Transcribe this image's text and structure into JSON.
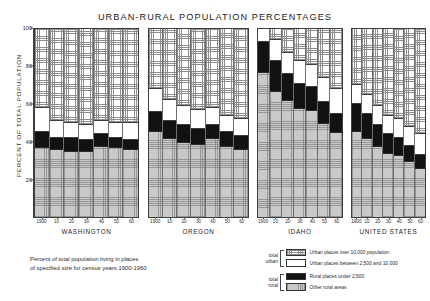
{
  "page_mark": "··",
  "chart_title": "URBAN-RURAL POPULATION PERCENTAGES",
  "y_axis_label": "PERCENT OF TOTAL POPULATION",
  "caption_line1": "Percent of total population living in places",
  "caption_line2": "of specified size for census years 1900-1960",
  "legend": {
    "group_urban_line1": "total",
    "group_urban_line2": "urban",
    "group_rural_line1": "total",
    "group_rural_line2": "rural",
    "items": [
      {
        "key": "urban-large",
        "label": "Urban places over 10,000 population"
      },
      {
        "key": "urban-small",
        "label": "Urban places between 2,500 and 10,000"
      },
      {
        "key": "rural-place",
        "label": "Rural places under 2,500"
      },
      {
        "key": "rural-other",
        "label": "Other rural areas"
      }
    ]
  },
  "chart_data": {
    "type": "bar",
    "subtype": "stacked-100-percent",
    "title": "URBAN-RURAL POPULATION PERCENTAGES",
    "xlabel": "",
    "ylabel": "PERCENT OF TOTAL POPULATION",
    "ylim": [
      0,
      100
    ],
    "yticks": [
      20,
      40,
      60,
      80,
      100
    ],
    "grid": false,
    "legend_position": "bottom-right",
    "categories": [
      "1900",
      "10",
      "20",
      "30",
      "40",
      "50",
      "60"
    ],
    "series_order": [
      "rural-other",
      "rural-place",
      "urban-small",
      "urban-large"
    ],
    "series_labels": {
      "urban-large": "Urban places over 10,000 population",
      "urban-small": "Urban places between 2,500 and 10,000",
      "rural-place": "Rural places under 2,500",
      "rural-other": "Other rural areas"
    },
    "panels": [
      {
        "name": "WASHINGTON",
        "series": [
          {
            "name": "rural-other",
            "values": [
              37,
              36,
              35,
              35,
              38,
              37,
              36
            ]
          },
          {
            "name": "rural-place",
            "values": [
              8,
              6,
              7,
              6,
              6,
              5,
              5
            ]
          },
          {
            "name": "urban-small",
            "values": [
              13,
              9,
              8,
              8,
              7,
              8,
              9
            ]
          },
          {
            "name": "urban-large",
            "values": [
              42,
              49,
              50,
              51,
              49,
              50,
              50
            ]
          }
        ]
      },
      {
        "name": "OREGON",
        "series": [
          {
            "name": "rural-other",
            "values": [
              46,
              42,
              40,
              39,
              42,
              38,
              36
            ]
          },
          {
            "name": "rural-place",
            "values": [
              10,
              9,
              9,
              8,
              7,
              7,
              7
            ]
          },
          {
            "name": "urban-small",
            "values": [
              12,
              11,
              10,
              10,
              9,
              9,
              9
            ]
          },
          {
            "name": "urban-large",
            "values": [
              32,
              38,
              41,
              43,
              42,
              46,
              48
            ]
          }
        ]
      },
      {
        "name": "IDAHO",
        "series": [
          {
            "name": "rural-other",
            "values": [
              77,
              67,
              62,
              58,
              57,
              50,
              45
            ]
          },
          {
            "name": "rural-place",
            "values": [
              16,
              16,
              14,
              13,
              12,
              11,
              10
            ]
          },
          {
            "name": "urban-small",
            "values": [
              7,
              11,
              11,
              12,
              12,
              13,
              13
            ]
          },
          {
            "name": "urban-large",
            "values": [
              0,
              6,
              13,
              17,
              19,
              26,
              32
            ]
          }
        ]
      },
      {
        "name": "UNITED STATES",
        "series": [
          {
            "name": "rural-other",
            "values": [
              46,
              42,
              38,
              34,
              33,
              30,
              26
            ]
          },
          {
            "name": "rural-place",
            "values": [
              14,
              13,
              11,
              10,
              9,
              8,
              7
            ]
          },
          {
            "name": "urban-small",
            "values": [
              10,
              10,
              10,
              10,
              10,
              10,
              11
            ]
          },
          {
            "name": "urban-large",
            "values": [
              30,
              35,
              41,
              46,
              48,
              52,
              56
            ]
          }
        ]
      }
    ]
  }
}
